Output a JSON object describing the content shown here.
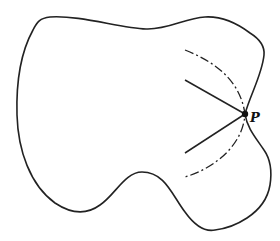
{
  "figure": {
    "point_label": "P",
    "colors": {
      "stroke": "#222222",
      "background": "#ffffff"
    },
    "elements": [
      {
        "type": "closed-curve",
        "description": "irregular region boundary"
      },
      {
        "type": "point",
        "label": "P",
        "position": [
          245,
          114
        ],
        "location": "on boundary at inward cusp on right side"
      },
      {
        "type": "solid-segment",
        "from": [
          185,
          80
        ],
        "to": [
          245,
          114
        ]
      },
      {
        "type": "solid-segment",
        "from": [
          185,
          153
        ],
        "to": [
          245,
          114
        ]
      },
      {
        "type": "dash-dot-arc",
        "from": [
          185,
          50
        ],
        "through": [
          245,
          114
        ],
        "to": [
          185,
          177
        ]
      }
    ]
  }
}
